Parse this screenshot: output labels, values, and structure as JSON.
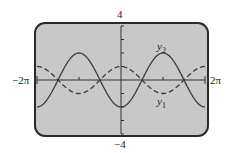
{
  "chart_data": {
    "type": "line",
    "title": "",
    "xlabel": "",
    "ylabel": "",
    "xlim": [
      "-2π",
      "2π"
    ],
    "ylim": [
      -4,
      4
    ],
    "x_tick_labels": [
      "-2π",
      "2π"
    ],
    "y_tick_labels": [
      "4",
      "-4"
    ],
    "grid": false,
    "series": [
      {
        "name": "y1",
        "style": "dashed",
        "function": "cos x",
        "amplitude": 1
      },
      {
        "name": "y2",
        "style": "solid",
        "function": "-2 cos x",
        "amplitude": 2
      }
    ],
    "annotations": [
      "y1",
      "y2"
    ]
  },
  "labels": {
    "ymax": "4",
    "ymin": "−4",
    "xmin": "−2π",
    "xmax": "2π",
    "y1_main": "y",
    "y1_sub": "1",
    "y2_main": "y",
    "y2_sub": "2"
  },
  "colors": {
    "screen": "#c8c8c8",
    "border": "#2a2a2a",
    "curve": "#3a3a3a"
  }
}
